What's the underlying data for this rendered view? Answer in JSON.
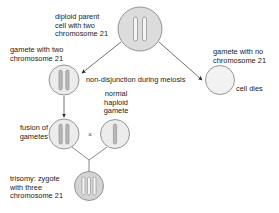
{
  "diagram": {
    "colors": {
      "cell_fill": "#dcdcdc",
      "cell_stroke": "#8a8a8a",
      "empty_cell_fill": "#f2f2f2",
      "chromosome_fill": "#f4f4f4",
      "chromosome_stroke": "#8a8a8a",
      "chromosome_dark_fill": "#b8b8b8",
      "arrow": "#333333",
      "text": "#222222"
    },
    "nodes": {
      "parent": {
        "label_lines": [
          "diploid parent",
          "cell with two",
          "chromosome 21"
        ],
        "chromosome_count": 2
      },
      "gamete_two": {
        "label_lines": [
          "gamete with two",
          "chromosome 21"
        ],
        "chromosome_count": 2
      },
      "gamete_none": {
        "label_lines": [
          "gamete with no",
          "chromosome 21"
        ],
        "chromosome_count": 0,
        "outcome_label": "cell dies"
      },
      "fusion": {
        "label_lines": [
          "fusion of",
          "gametes"
        ],
        "chromosome_count": 2
      },
      "normal_gamete": {
        "label_lines": [
          "normal",
          "haploid",
          "gamete"
        ],
        "chromosome_count": 1
      },
      "zygote": {
        "label_lines": [
          "trisomy: zygote",
          "with three",
          "chromosome 21"
        ],
        "chromosome_count": 3
      }
    },
    "edges": {
      "nondisjunction_label": "non-disjunction during meiosis",
      "cross_symbol": "×"
    }
  }
}
